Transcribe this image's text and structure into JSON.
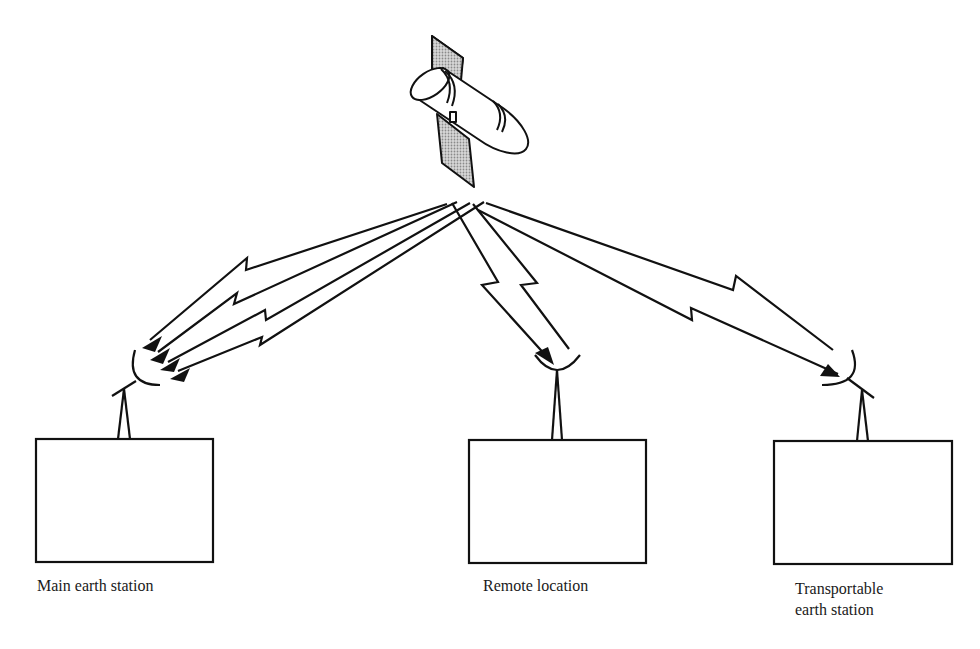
{
  "diagram": {
    "type": "satellite-communication-network",
    "satellite": {
      "icon": "satellite-icon"
    },
    "stations": [
      {
        "id": "main",
        "label_lines": [
          "Main earth station"
        ],
        "icon": "dish-antenna-icon",
        "links": 4
      },
      {
        "id": "remote",
        "label_lines": [
          "Remote location"
        ],
        "icon": "dish-antenna-icon",
        "links": 2
      },
      {
        "id": "transportable",
        "label_lines": [
          "Transportable",
          "earth station"
        ],
        "icon": "dish-antenna-icon",
        "links": 2
      }
    ],
    "colors": {
      "line": "#111111",
      "panel_fill": "#b5b5b5",
      "background": "#ffffff"
    }
  }
}
